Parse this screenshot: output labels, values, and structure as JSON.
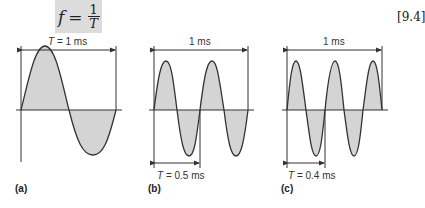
{
  "equation": {
    "lhs": "f",
    "equals": "=",
    "numerator": "1",
    "denominator": "T",
    "number": "[9.4]"
  },
  "panels": [
    {
      "id": "a",
      "label": "(a)",
      "top_label": "T = 1 ms",
      "top_label_T": "T",
      "top_label_rest": " = 1 ms",
      "bottom_label": "",
      "cycles": 1,
      "period_ms": 1
    },
    {
      "id": "b",
      "label": "(b)",
      "top_label": "1 ms",
      "bottom_label_T": "T",
      "bottom_label_rest": " = 0.5 ms",
      "cycles": 2,
      "period_ms": 0.5
    },
    {
      "id": "c",
      "label": "(c)",
      "top_label": "1 ms",
      "bottom_label_T": "T",
      "bottom_label_rest": " = 0.4 ms",
      "cycles": 2.5,
      "period_ms": 0.4
    }
  ],
  "colors": {
    "fill": "#d4d4d4",
    "stroke": "#333333"
  }
}
